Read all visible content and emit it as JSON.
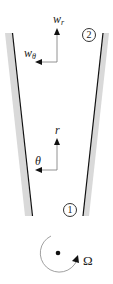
{
  "figure": {
    "type": "diverging channel / rotating passage schematic",
    "labels": {
      "w_r_main": "w",
      "w_r_sub": "r",
      "w_theta_main": "w",
      "w_theta_sub": "θ",
      "r": "r",
      "theta": "θ",
      "station_2": "2",
      "station_1": "1",
      "omega": "Ω"
    },
    "colors": {
      "wall_fill": "#d9d9d9",
      "wall_line": "#111111",
      "arrow": "#555555",
      "text": "#222222"
    }
  }
}
